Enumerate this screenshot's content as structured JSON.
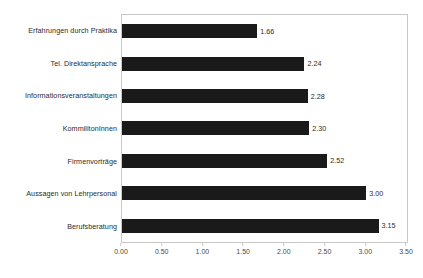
{
  "chart_data": {
    "type": "bar",
    "orientation": "horizontal",
    "title": "",
    "subtitle": "",
    "xlabel": "",
    "ylabel": "",
    "categories": [
      "Erfahrungen durch Praktika",
      "Tel. Direktansprache",
      "Informationsveranstaltungen",
      "KommilitonInnen",
      "Firmenvorträge",
      "Aussagen von Lehrpersonal",
      "Berufsberatung"
    ],
    "values": [
      1.66,
      2.24,
      2.28,
      2.3,
      2.52,
      3.0,
      3.15
    ],
    "value_labels": [
      "1.66",
      "2.24",
      "2.28",
      "2.30",
      "2.52",
      "3.00",
      "3.15"
    ],
    "xlim": [
      0.0,
      3.5
    ],
    "xticks": [
      0.0,
      0.5,
      1.0,
      1.5,
      2.0,
      2.5,
      3.0,
      3.5
    ],
    "xtick_labels": [
      "0.00",
      "0.50",
      "1.00",
      "1.50",
      "2.00",
      "2.50",
      "3.00",
      "3.50"
    ],
    "grid": false,
    "legend": null,
    "legend_position": "none",
    "colors": {
      "bar": "#1a1a1a",
      "plot_border": "#c9c9c9",
      "background": "#ffffff",
      "label_text": "#2b2b2b",
      "tick_text": "#4a4a4a"
    }
  }
}
